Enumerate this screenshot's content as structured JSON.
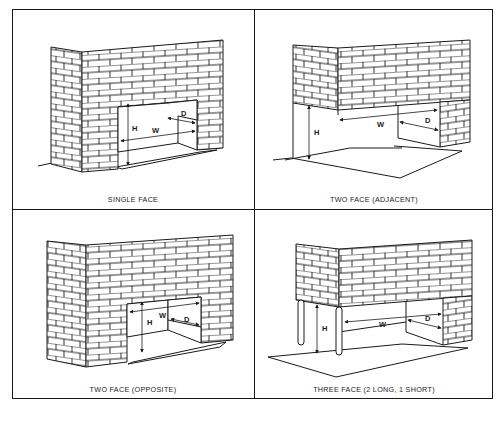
{
  "figure": {
    "panels": [
      {
        "id": "single-face",
        "caption": "SINGLE FACE",
        "labels": {
          "h": "H",
          "w": "W",
          "d": "D"
        }
      },
      {
        "id": "two-face-adjacent",
        "caption": "TWO FACE (ADJACENT)",
        "labels": {
          "h": "H",
          "w": "W",
          "d": "D"
        }
      },
      {
        "id": "two-face-opposite",
        "caption": "TWO FACE (OPPOSITE)",
        "labels": {
          "h": "H",
          "w": "W",
          "d": "D"
        }
      },
      {
        "id": "three-face",
        "caption": "THREE FACE (2 LONG, 1 SHORT)",
        "labels": {
          "h": "H",
          "w": "W",
          "d": "D"
        }
      }
    ],
    "colors": {
      "line": "#1a1a1a",
      "background": "#ffffff"
    }
  }
}
